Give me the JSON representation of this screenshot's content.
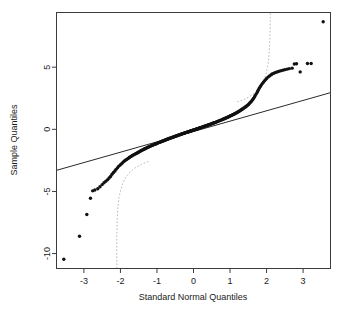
{
  "chart_data": {
    "type": "scatter",
    "title": "",
    "subtitle": "",
    "xlabel": "Standard Normal Quantiles",
    "ylabel": "Sample Quantiles",
    "xlim": [
      -3.75,
      3.75
    ],
    "ylim": [
      -11.2,
      9.4
    ],
    "xticks": [
      -3,
      -2,
      -1,
      0,
      1,
      2,
      3
    ],
    "xticklabels": [
      "-3",
      "-2",
      "-1",
      "0",
      "1",
      "2",
      "3"
    ],
    "yticks": [
      5,
      0,
      -5,
      -10
    ],
    "yticklabels": [
      "5",
      "0",
      "-5",
      "-10"
    ],
    "grid": false,
    "legend": null,
    "series": [
      {
        "name": "Sample quantiles",
        "marker": "filled-circle",
        "color": "#111111",
        "x": [
          -3.55,
          -3.12,
          -2.92,
          -2.82,
          -2.76,
          -2.7,
          -2.62,
          -2.56,
          -2.5,
          -2.45,
          -2.4,
          -2.35,
          -2.31,
          -2.27,
          -2.23,
          -2.19,
          -2.15,
          -2.12,
          -2.08,
          -2.05,
          -2.01,
          -1.98,
          -1.95,
          -1.92,
          -1.89,
          -1.86,
          -1.83,
          -1.8,
          -1.77,
          -1.75,
          -1.72,
          -1.69,
          -1.67,
          -1.64,
          -1.62,
          -1.59,
          -1.57,
          -1.54,
          -1.52,
          -1.5,
          -1.47,
          -1.45,
          -1.43,
          -1.41,
          -1.38,
          -1.36,
          -1.34,
          -1.32,
          -1.3,
          -1.28,
          -1.26,
          -1.24,
          -1.22,
          -1.2,
          -1.18,
          -1.16,
          -1.14,
          -1.12,
          -1.1,
          -1.08,
          -1.06,
          -1.04,
          -1.02,
          -1.0,
          -0.98,
          -0.97,
          -0.95,
          -0.93,
          -0.91,
          -0.89,
          -0.87,
          -0.86,
          -0.84,
          -0.82,
          -0.8,
          -0.79,
          -0.77,
          -0.75,
          -0.73,
          -0.72,
          -0.7,
          -0.68,
          -0.67,
          -0.65,
          -0.63,
          -0.62,
          -0.6,
          -0.58,
          -0.57,
          -0.55,
          -0.53,
          -0.52,
          -0.5,
          -0.48,
          -0.47,
          -0.45,
          -0.44,
          -0.42,
          -0.4,
          -0.39,
          -0.37,
          -0.35,
          -0.34,
          -0.32,
          -0.31,
          -0.29,
          -0.27,
          -0.26,
          -0.24,
          -0.23,
          -0.21,
          -0.19,
          -0.18,
          -0.16,
          -0.15,
          -0.13,
          -0.11,
          -0.1,
          -0.08,
          -0.07,
          -0.05,
          -0.03,
          -0.02,
          0.0,
          0.02,
          0.03,
          0.05,
          0.07,
          0.08,
          0.1,
          0.11,
          0.13,
          0.15,
          0.16,
          0.18,
          0.19,
          0.21,
          0.23,
          0.24,
          0.26,
          0.27,
          0.29,
          0.31,
          0.32,
          0.34,
          0.35,
          0.37,
          0.39,
          0.4,
          0.42,
          0.44,
          0.45,
          0.47,
          0.48,
          0.5,
          0.52,
          0.53,
          0.55,
          0.57,
          0.58,
          0.6,
          0.62,
          0.63,
          0.65,
          0.67,
          0.68,
          0.7,
          0.72,
          0.73,
          0.75,
          0.77,
          0.79,
          0.8,
          0.82,
          0.84,
          0.86,
          0.87,
          0.89,
          0.91,
          0.93,
          0.95,
          0.97,
          0.98,
          1.0,
          1.02,
          1.04,
          1.06,
          1.08,
          1.1,
          1.12,
          1.14,
          1.16,
          1.18,
          1.2,
          1.22,
          1.24,
          1.26,
          1.28,
          1.3,
          1.32,
          1.34,
          1.36,
          1.38,
          1.41,
          1.43,
          1.45,
          1.47,
          1.5,
          1.52,
          1.54,
          1.57,
          1.59,
          1.62,
          1.64,
          1.67,
          1.69,
          1.72,
          1.75,
          1.77,
          1.8,
          1.83,
          1.86,
          1.89,
          1.92,
          1.95,
          1.98,
          2.01,
          2.05,
          2.08,
          2.12,
          2.15,
          2.19,
          2.23,
          2.27,
          2.31,
          2.35,
          2.4,
          2.45,
          2.5,
          2.56,
          2.62,
          2.7,
          2.76,
          2.82,
          2.92,
          3.12,
          3.22,
          3.55
        ],
        "y": [
          -10.45,
          -8.6,
          -6.85,
          -5.55,
          -4.95,
          -4.88,
          -4.78,
          -4.62,
          -4.45,
          -4.3,
          -4.18,
          -4.05,
          -3.92,
          -3.8,
          -3.62,
          -3.48,
          -3.35,
          -3.22,
          -3.1,
          -2.98,
          -2.88,
          -2.8,
          -2.72,
          -2.62,
          -2.55,
          -2.48,
          -2.42,
          -2.36,
          -2.3,
          -2.25,
          -2.2,
          -2.15,
          -2.1,
          -2.06,
          -2.02,
          -1.98,
          -1.94,
          -1.9,
          -1.86,
          -1.82,
          -1.78,
          -1.74,
          -1.71,
          -1.68,
          -1.64,
          -1.61,
          -1.58,
          -1.55,
          -1.52,
          -1.49,
          -1.46,
          -1.43,
          -1.41,
          -1.38,
          -1.35,
          -1.33,
          -1.3,
          -1.28,
          -1.25,
          -1.23,
          -1.2,
          -1.18,
          -1.16,
          -1.13,
          -1.11,
          -1.09,
          -1.07,
          -1.05,
          -1.02,
          -1.0,
          -0.98,
          -0.96,
          -0.94,
          -0.92,
          -0.9,
          -0.88,
          -0.86,
          -0.84,
          -0.82,
          -0.8,
          -0.78,
          -0.76,
          -0.74,
          -0.72,
          -0.71,
          -0.69,
          -0.67,
          -0.65,
          -0.63,
          -0.62,
          -0.6,
          -0.58,
          -0.56,
          -0.55,
          -0.53,
          -0.51,
          -0.5,
          -0.48,
          -0.46,
          -0.45,
          -0.43,
          -0.41,
          -0.4,
          -0.38,
          -0.36,
          -0.35,
          -0.33,
          -0.31,
          -0.3,
          -0.28,
          -0.27,
          -0.25,
          -0.23,
          -0.22,
          -0.2,
          -0.19,
          -0.17,
          -0.15,
          -0.14,
          -0.12,
          -0.11,
          -0.09,
          -0.07,
          -0.06,
          -0.04,
          -0.03,
          -0.01,
          0.01,
          0.02,
          0.04,
          0.05,
          0.07,
          0.09,
          0.1,
          0.12,
          0.13,
          0.15,
          0.17,
          0.18,
          0.2,
          0.22,
          0.23,
          0.25,
          0.27,
          0.28,
          0.3,
          0.32,
          0.33,
          0.35,
          0.37,
          0.38,
          0.4,
          0.42,
          0.44,
          0.45,
          0.47,
          0.49,
          0.51,
          0.53,
          0.54,
          0.56,
          0.58,
          0.6,
          0.62,
          0.64,
          0.66,
          0.68,
          0.7,
          0.72,
          0.74,
          0.76,
          0.78,
          0.8,
          0.83,
          0.85,
          0.87,
          0.89,
          0.92,
          0.94,
          0.97,
          0.99,
          1.02,
          1.04,
          1.07,
          1.1,
          1.12,
          1.15,
          1.18,
          1.21,
          1.24,
          1.27,
          1.3,
          1.34,
          1.37,
          1.4,
          1.44,
          1.48,
          1.51,
          1.55,
          1.59,
          1.63,
          1.68,
          1.72,
          1.77,
          1.82,
          1.87,
          1.92,
          1.98,
          2.05,
          2.12,
          2.2,
          2.28,
          2.38,
          2.48,
          2.6,
          2.72,
          2.86,
          3.0,
          3.15,
          3.3,
          3.45,
          3.58,
          3.7,
          3.82,
          3.92,
          4.02,
          4.12,
          4.22,
          4.3,
          4.38,
          4.45,
          4.5,
          4.56,
          4.6,
          4.64,
          4.68,
          4.72,
          4.76,
          4.8,
          4.84,
          4.88,
          4.92,
          5.25,
          5.28,
          4.62,
          5.3,
          5.3,
          8.65
        ]
      }
    ],
    "reference_line": {
      "name": "qqline",
      "style": "solid",
      "color": "#2a2a2a",
      "x": [
        -3.75,
        3.75
      ],
      "y": [
        -3.3,
        2.95
      ]
    },
    "confidence_bands": [
      {
        "name": "lower-confidence-band",
        "style": "dotted",
        "color": "#b9b9b9",
        "x": [
          -2.1,
          -2.1,
          -2.09,
          -2.07,
          -2.04,
          -1.99,
          -1.93,
          -1.85,
          -1.74,
          -1.6,
          -1.42,
          -1.2
        ],
        "y": [
          -11.2,
          -9.0,
          -7.4,
          -6.3,
          -5.5,
          -4.85,
          -4.3,
          -3.85,
          -3.45,
          -3.1,
          -2.8,
          -2.55
        ]
      },
      {
        "name": "upper-confidence-band",
        "style": "dotted",
        "color": "#b9b9b9",
        "x": [
          1.2,
          1.42,
          1.6,
          1.74,
          1.85,
          1.93,
          1.99,
          2.04,
          2.07,
          2.09,
          2.1,
          2.1
        ],
        "y": [
          2.2,
          2.45,
          2.75,
          3.1,
          3.5,
          3.95,
          4.5,
          5.2,
          6.1,
          7.2,
          8.5,
          9.4
        ]
      }
    ]
  },
  "axes": {
    "x_title": "Standard Normal Quantiles",
    "y_title": "Sample Quantiles",
    "x_tick_labels": [
      "-3",
      "-2",
      "-1",
      "0",
      "1",
      "2",
      "3"
    ],
    "y_tick_labels": [
      "5",
      "0",
      "-5",
      "-10"
    ]
  },
  "colors": {
    "point": "#111111",
    "frame": "#3c3c3c",
    "reference_line": "#2a2a2a",
    "band": "#b9b9b9",
    "background": "#ffffff",
    "text": "#1a1a1a"
  }
}
